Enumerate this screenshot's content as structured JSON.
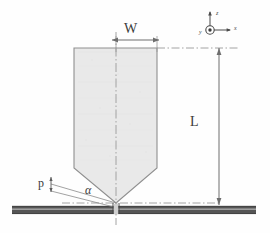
{
  "figure": {
    "background_color": "#fefefe"
  },
  "labels": {
    "width": "W",
    "length": "L",
    "cone_angle": "α",
    "plate_thickness": "p"
  },
  "axes": {
    "z_label": "z",
    "x_label": "x",
    "y_label": "y"
  },
  "colors": {
    "body_fill": "#e8e8e8",
    "body_stroke": "#8f8f8f",
    "plate_dark": "#4a4a4a",
    "plate_light": "#8c8c8c",
    "dimension_line": "#6e6e6e",
    "centerline": "#9a9a9a",
    "text": "#3b3b3b"
  },
  "geometry": {
    "body_left_x": 74,
    "body_right_x": 157,
    "body_top_y": 48,
    "body_shoulder_y": 168,
    "tip_x": 116,
    "tip_y": 203,
    "plate_top_y": 206,
    "plate_bottom_y": 214,
    "plate_left_x": 12,
    "plate_right_x": 256,
    "dim_L_x": 219,
    "dim_W_y": 40
  }
}
